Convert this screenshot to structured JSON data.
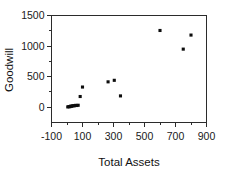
{
  "chart_data": {
    "type": "scatter",
    "title": "",
    "xlabel": "Total Assets",
    "ylabel": "Goodwill",
    "xlim": [
      -100,
      900
    ],
    "ylim": [
      -250,
      1500
    ],
    "grid": false,
    "legend": null,
    "x_ticks": [
      -100,
      100,
      300,
      500,
      700,
      900
    ],
    "x_tick_labels": [
      "-100",
      "100",
      "300",
      "500",
      "700",
      "900"
    ],
    "x_minor_ticks": [
      0,
      200,
      400,
      600,
      800
    ],
    "y_ticks": [
      0,
      500,
      1000,
      1500
    ],
    "y_tick_labels": [
      "0",
      "500",
      "1000",
      "1500"
    ],
    "y_minor_ticks": [
      250,
      750,
      1250
    ],
    "marker_color": "#0d0d0d",
    "marker_shape": "square",
    "points": [
      {
        "x": 5,
        "y": 5
      },
      {
        "x": 12,
        "y": 10
      },
      {
        "x": 18,
        "y": 8
      },
      {
        "x": 24,
        "y": 18
      },
      {
        "x": 30,
        "y": 15
      },
      {
        "x": 38,
        "y": 25
      },
      {
        "x": 46,
        "y": 22
      },
      {
        "x": 55,
        "y": 30
      },
      {
        "x": 63,
        "y": 28
      },
      {
        "x": 72,
        "y": 32
      },
      {
        "x": 85,
        "y": 175
      },
      {
        "x": 100,
        "y": 330
      },
      {
        "x": 265,
        "y": 415
      },
      {
        "x": 305,
        "y": 440
      },
      {
        "x": 345,
        "y": 185
      },
      {
        "x": 600,
        "y": 1255
      },
      {
        "x": 750,
        "y": 950
      },
      {
        "x": 800,
        "y": 1180
      }
    ]
  },
  "axes": {
    "x_title": "Total Assets",
    "y_title": "Goodwill"
  }
}
